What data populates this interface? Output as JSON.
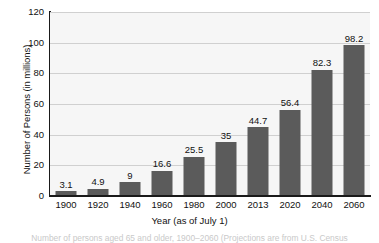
{
  "chart_data": {
    "type": "bar",
    "title": "",
    "xlabel": "Year (as of July 1)",
    "ylabel": "Number of Persons (in millions)",
    "categories": [
      "1900",
      "1920",
      "1940",
      "1960",
      "1980",
      "2000",
      "2013",
      "2020",
      "2040",
      "2060"
    ],
    "values": [
      3.1,
      4.9,
      9,
      16.6,
      25.5,
      35,
      44.7,
      56.4,
      82.3,
      98.2
    ],
    "value_labels": [
      "3.1",
      "4.9",
      "9",
      "16.6",
      "25.5",
      "35",
      "44.7",
      "56.4",
      "82.3",
      "98.2"
    ],
    "ylim": [
      0,
      120
    ],
    "yticks": [
      0,
      20,
      40,
      60,
      80,
      100,
      120
    ],
    "ytick_labels": [
      "0",
      "20",
      "40",
      "60",
      "80",
      "100",
      "120"
    ],
    "grid": true,
    "legend": false,
    "bar_color": "#5b5b5b",
    "plot_background": "#f6f6f6",
    "gridline_color": "#d0d0d0",
    "axis_color": "#1a1a1a"
  },
  "caption": {
    "text": "Number of persons aged 65 and older, 1900–2060 (Projections are from U.S. Census"
  }
}
